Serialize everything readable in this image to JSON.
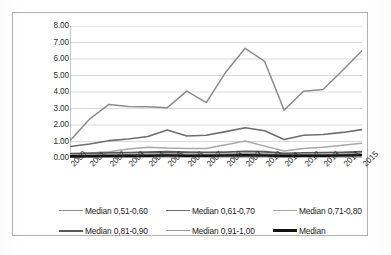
{
  "chart_data": {
    "type": "line",
    "title": "",
    "xlabel": "",
    "ylabel": "",
    "grid": true,
    "legend_position": "bottom",
    "ylim": [
      0,
      8
    ],
    "ytick_labels": [
      "8.00",
      "7.00",
      "6.00",
      "5.00",
      "4.00",
      "3.00",
      "2.00",
      "1.00",
      "0.00"
    ],
    "ytick_values": [
      8,
      7,
      6,
      5,
      4,
      3,
      2,
      1,
      0
    ],
    "categories": [
      "2000",
      "2001",
      "2002",
      "2003",
      "2004",
      "2005",
      "2006",
      "2007",
      "2008",
      "2009",
      "2010",
      "2011",
      "2012",
      "2013",
      "2014",
      "2015"
    ],
    "series": [
      {
        "name": "Median 0,51-0,60",
        "color": "#8c8c8c",
        "width": 1.5,
        "values": [
          1.05,
          2.35,
          3.25,
          3.12,
          3.1,
          3.05,
          4.05,
          3.35,
          5.2,
          6.65,
          5.85,
          2.9,
          4.05,
          4.15,
          5.3,
          6.5
        ]
      },
      {
        "name": "Median 0,61-0,70",
        "color": "#6e6e6e",
        "width": 1.6,
        "values": [
          0.7,
          0.85,
          1.05,
          1.15,
          1.3,
          1.7,
          1.33,
          1.38,
          1.6,
          1.83,
          1.65,
          1.12,
          1.38,
          1.42,
          1.55,
          1.72
        ]
      },
      {
        "name": "Median 0,71-0,80",
        "color": "#a8a8a8",
        "width": 1.5,
        "values": [
          0.22,
          0.3,
          0.38,
          0.55,
          0.65,
          0.6,
          0.58,
          0.58,
          0.8,
          1.03,
          0.72,
          0.42,
          0.58,
          0.65,
          0.78,
          0.9
        ]
      },
      {
        "name": "Median 0,81-0,90",
        "color": "#5a5a5a",
        "width": 1.8,
        "values": [
          0.26,
          0.28,
          0.31,
          0.33,
          0.36,
          0.38,
          0.35,
          0.34,
          0.36,
          0.4,
          0.38,
          0.28,
          0.31,
          0.32,
          0.34,
          0.38
        ]
      },
      {
        "name": "Median 0,91-1,00",
        "color": "#9a9a9a",
        "width": 1.5,
        "values": [
          0.18,
          0.19,
          0.21,
          0.23,
          0.25,
          0.26,
          0.24,
          0.23,
          0.25,
          0.28,
          0.26,
          0.2,
          0.22,
          0.23,
          0.25,
          0.28
        ]
      },
      {
        "name": "Median",
        "color": "#111111",
        "width": 2.6,
        "values": [
          0.1,
          0.11,
          0.12,
          0.13,
          0.14,
          0.15,
          0.14,
          0.14,
          0.15,
          0.16,
          0.15,
          0.13,
          0.14,
          0.14,
          0.15,
          0.17
        ]
      }
    ]
  },
  "legend": {
    "rows": [
      [
        {
          "label": "Median 0,51-0,60",
          "color": "#8c8c8c",
          "width": 1.6
        },
        {
          "label": "Median 0,61-0,70",
          "color": "#6e6e6e",
          "width": 1.8
        },
        {
          "label": "Median 0,71-0,80",
          "color": "#a8a8a8",
          "width": 1.6
        }
      ],
      [
        {
          "label": "Median 0,81-0,90",
          "color": "#5a5a5a",
          "width": 2.0
        },
        {
          "label": "Median 0,91-1,00",
          "color": "#9a9a9a",
          "width": 1.6
        },
        {
          "label": "Median",
          "color": "#111111",
          "width": 3.0
        }
      ]
    ]
  },
  "axis": {
    "line_color": "#808080",
    "grid_color": "#c9c9c9",
    "label_color": "#2b2b2b"
  }
}
